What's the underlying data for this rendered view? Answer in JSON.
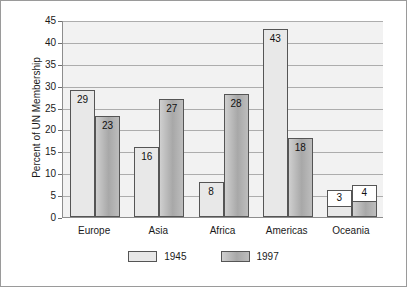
{
  "chart_data": {
    "type": "bar",
    "title": "",
    "xlabel": "",
    "ylabel": "Percent of UN Membership",
    "ylim": [
      0,
      45
    ],
    "ytick_step": 5,
    "yticks": [
      "0",
      "5",
      "10",
      "15",
      "20",
      "25",
      "30",
      "35",
      "40",
      "45"
    ],
    "grid": true,
    "legend_position": "bottom-center",
    "categories": [
      "Europe",
      "Asia",
      "Africa",
      "Americas",
      "Oceania"
    ],
    "series": [
      {
        "name": "1945",
        "values": [
          29,
          16,
          8,
          43,
          3
        ]
      },
      {
        "name": "1997",
        "values": [
          23,
          27,
          28,
          18,
          4
        ]
      }
    ],
    "value_labels": {
      "Europe": [
        "29",
        "23"
      ],
      "Asia": [
        "16",
        "27"
      ],
      "Africa": [
        "8",
        "28"
      ],
      "Americas": [
        "43",
        "18"
      ],
      "Oceania": [
        "3",
        "4"
      ]
    }
  },
  "colors": {
    "series_1945": "#e8e8e8",
    "series_1997": "#b0b0b0",
    "plot_background": "#f2f2f2",
    "gridline": "#adadad",
    "axis": "#8d8d8d",
    "bar_outline": "#555555",
    "text": "#1a1a1a",
    "figure_border": "#9a9a9a"
  },
  "legend": {
    "entries": [
      {
        "label": "1945",
        "swatch": "series_1945"
      },
      {
        "label": "1997",
        "swatch": "series_1997"
      }
    ]
  }
}
